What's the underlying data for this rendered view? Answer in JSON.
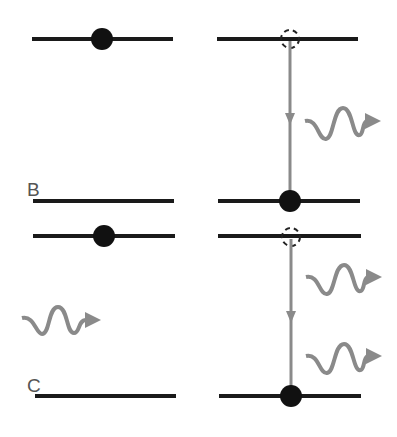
{
  "diagram": {
    "colors": {
      "level": "#1a1a1a",
      "electron": "#111111",
      "transition": "#8a8a8a",
      "photon": "#8a8a8a",
      "label": "#555555"
    },
    "panels": [
      {
        "label": "B",
        "description": "Excited electron decays, emitting one photon",
        "before": {
          "electron": "upper",
          "incoming_photon": false
        },
        "after": {
          "electron": "lower",
          "emitted_photons": 1
        }
      },
      {
        "label": "C",
        "description": "Incoming photon stimulates decay, two photons emitted",
        "before": {
          "electron": "upper",
          "incoming_photon": true
        },
        "after": {
          "electron": "lower",
          "emitted_photons": 2
        }
      }
    ]
  }
}
